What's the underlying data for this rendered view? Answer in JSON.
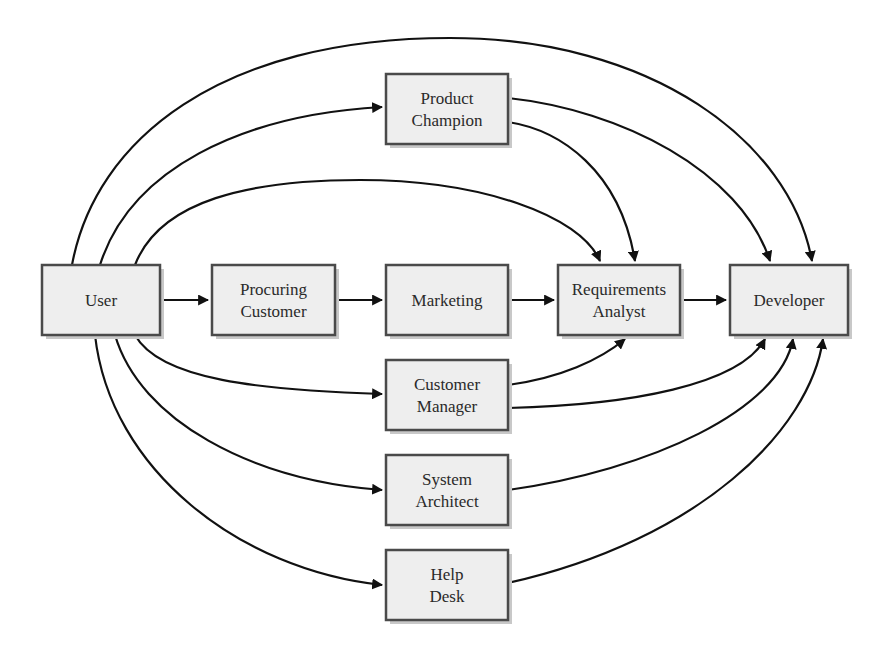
{
  "diagram": {
    "title": "",
    "nodes": [
      {
        "id": "user",
        "lines": [
          "User"
        ],
        "x": 42,
        "y": 265,
        "w": 118,
        "h": 70
      },
      {
        "id": "procuring_customer",
        "lines": [
          "Procuring",
          "Customer"
        ],
        "x": 212,
        "y": 265,
        "w": 123,
        "h": 70
      },
      {
        "id": "marketing",
        "lines": [
          "Marketing"
        ],
        "x": 386,
        "y": 265,
        "w": 122,
        "h": 70
      },
      {
        "id": "requirements_analyst",
        "lines": [
          "Requirements",
          "Analyst"
        ],
        "x": 558,
        "y": 265,
        "w": 122,
        "h": 70
      },
      {
        "id": "developer",
        "lines": [
          "Developer"
        ],
        "x": 730,
        "y": 265,
        "w": 118,
        "h": 70
      },
      {
        "id": "product_champion",
        "lines": [
          "Product",
          "Champion"
        ],
        "x": 386,
        "y": 74,
        "w": 122,
        "h": 70
      },
      {
        "id": "customer_manager",
        "lines": [
          "Customer",
          "Manager"
        ],
        "x": 386,
        "y": 360,
        "w": 122,
        "h": 70
      },
      {
        "id": "system_architect",
        "lines": [
          "System",
          "Architect"
        ],
        "x": 386,
        "y": 455,
        "w": 122,
        "h": 70
      },
      {
        "id": "help_desk",
        "lines": [
          "Help",
          "Desk"
        ],
        "x": 386,
        "y": 550,
        "w": 122,
        "h": 70
      }
    ],
    "edges": [
      {
        "from": "user",
        "to": "procuring_customer",
        "d": "M160,300 L208,300"
      },
      {
        "from": "procuring_customer",
        "to": "marketing",
        "d": "M335,300 L382,300"
      },
      {
        "from": "marketing",
        "to": "requirements_analyst",
        "d": "M508,300 L554,300"
      },
      {
        "from": "requirements_analyst",
        "to": "developer",
        "d": "M680,300 L726,300"
      },
      {
        "from": "user",
        "to": "product_champion",
        "d": "M100,265 C130,170 240,115 382,107"
      },
      {
        "from": "user",
        "to": "developer",
        "d": "M72,265 C95,140 220,38 450,38 C650,38 790,140 812,261"
      },
      {
        "from": "user",
        "to": "requirements_analyst",
        "d": "M135,265 C160,200 250,180 360,180 C480,180 580,215 600,261"
      },
      {
        "from": "product_champion",
        "to": "requirements_analyst",
        "d": "M508,122 C560,130 620,170 635,261"
      },
      {
        "from": "product_champion",
        "to": "developer",
        "d": "M508,98 C620,110 740,170 770,261"
      },
      {
        "from": "user",
        "to": "customer_manager",
        "d": "M135,335 C160,380 260,390 382,394"
      },
      {
        "from": "user",
        "to": "system_architect",
        "d": "M115,335 C140,420 250,480 382,490"
      },
      {
        "from": "user",
        "to": "help_desk",
        "d": "M95,335 C110,470 240,570 382,585"
      },
      {
        "from": "customer_manager",
        "to": "requirements_analyst",
        "d": "M508,385 C560,378 600,360 625,339"
      },
      {
        "from": "customer_manager",
        "to": "developer",
        "d": "M508,408 C630,405 740,385 765,339"
      },
      {
        "from": "system_architect",
        "to": "developer",
        "d": "M508,490 C650,470 780,410 793,339"
      },
      {
        "from": "help_desk",
        "to": "developer",
        "d": "M508,583 C700,540 810,430 823,339"
      }
    ]
  }
}
